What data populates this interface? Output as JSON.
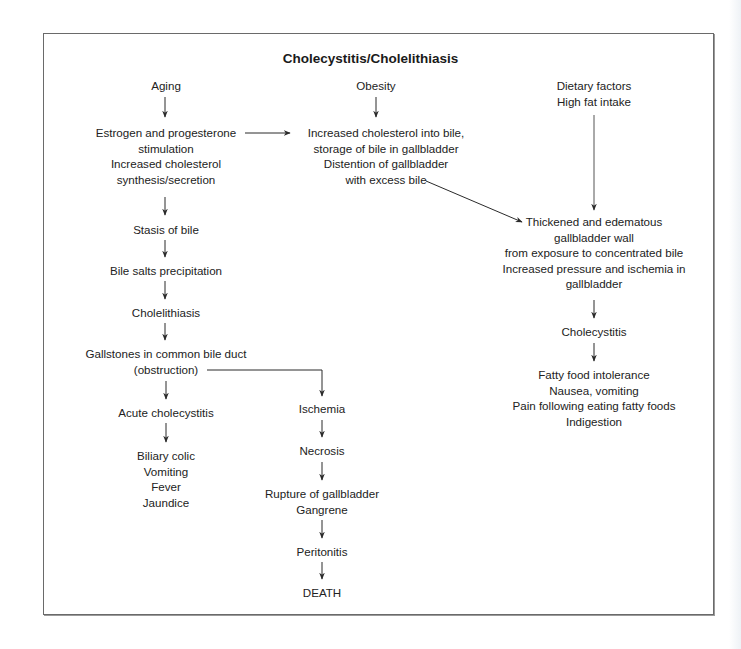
{
  "diagram": {
    "title": "Cholecystitis/Cholelithiasis",
    "nodes": {
      "aging": "Aging",
      "obesity": "Obesity",
      "dietary": "Dietary factors\nHigh fat intake",
      "estrogen": "Estrogen and progesterone\nstimulation\nIncreased cholesterol\nsynthesis/secretion",
      "increased_cholesterol": "Increased cholesterol into bile,\nstorage of bile in gallbladder\nDistention of gallbladder\nwith excess bile",
      "stasis": "Stasis of bile",
      "bile_salts": "Bile salts precipitation",
      "cholelithiasis": "Cholelithiasis",
      "gallstones": "Gallstones in common bile duct\n(obstruction)",
      "acute": "Acute cholecystitis",
      "acute_symptoms": "Biliary colic\nVomiting\nFever\nJaundice",
      "ischemia": "Ischemia",
      "necrosis": "Necrosis",
      "rupture": "Rupture of gallbladder\nGangrene",
      "peritonitis": "Peritonitis",
      "death": "DEATH",
      "thickened": "Thickened and edematous\ngallbladder wall\nfrom exposure to concentrated bile\nIncreased pressure and ischemia in\ngallbladder",
      "cholecystitis": "Cholecystitis",
      "cholecystitis_symptoms": "Fatty food intolerance\nNausea, vomiting\nPain following eating fatty foods\nIndigestion"
    },
    "edges": [
      [
        "aging",
        "estrogen"
      ],
      [
        "obesity",
        "increased_cholesterol"
      ],
      [
        "estrogen",
        "increased_cholesterol"
      ],
      [
        "increased_cholesterol",
        "thickened"
      ],
      [
        "dietary",
        "thickened"
      ],
      [
        "estrogen",
        "stasis"
      ],
      [
        "stasis",
        "bile_salts"
      ],
      [
        "bile_salts",
        "cholelithiasis"
      ],
      [
        "cholelithiasis",
        "gallstones"
      ],
      [
        "gallstones",
        "acute"
      ],
      [
        "gallstones",
        "ischemia"
      ],
      [
        "acute",
        "acute_symptoms"
      ],
      [
        "ischemia",
        "necrosis"
      ],
      [
        "necrosis",
        "rupture"
      ],
      [
        "rupture",
        "peritonitis"
      ],
      [
        "peritonitis",
        "death"
      ],
      [
        "thickened",
        "cholecystitis"
      ],
      [
        "cholecystitis",
        "cholecystitis_symptoms"
      ]
    ]
  },
  "colors": {
    "frame": "#6a6a6a",
    "text": "#222222",
    "arrow": "#2a2a2a"
  }
}
